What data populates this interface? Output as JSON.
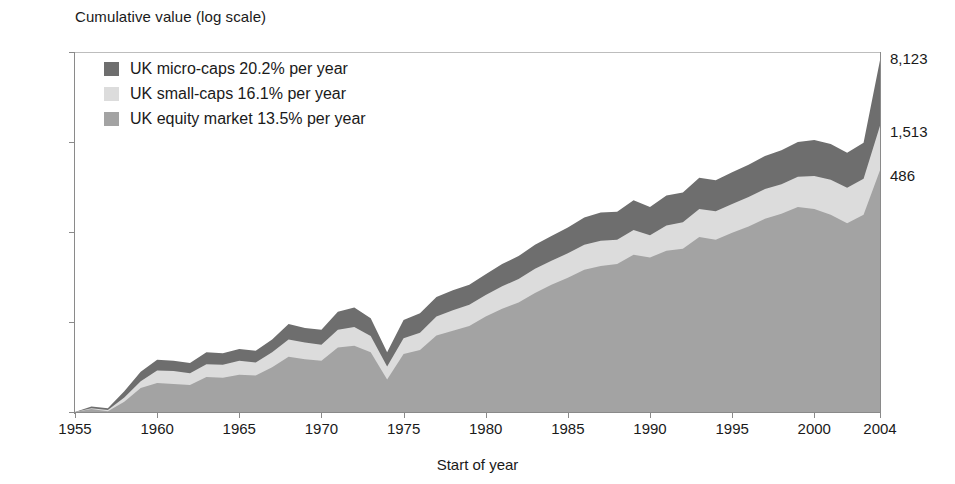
{
  "chart_data": {
    "type": "area",
    "title": "Cumulative value (log scale)",
    "xlabel": "Start of year",
    "ylabel": "Cumulative value (log scale)",
    "log_scale": true,
    "grid": false,
    "legend_position": "top-left",
    "xlim": [
      1955,
      2004
    ],
    "ylim": [
      1,
      10000
    ],
    "y_ticks": [
      "10,000",
      "1,000",
      "100",
      "10",
      "1"
    ],
    "y_tick_values": [
      10000,
      1000,
      100,
      10,
      1
    ],
    "x_ticks": [
      "1955",
      "1960",
      "1965",
      "1970",
      "1975",
      "1980",
      "1985",
      "1990",
      "1995",
      "2000",
      "2004"
    ],
    "x_tick_values": [
      1955,
      1960,
      1965,
      1970,
      1975,
      1980,
      1985,
      1990,
      1995,
      2000,
      2004
    ],
    "x": [
      1955,
      1956,
      1957,
      1958,
      1959,
      1960,
      1961,
      1962,
      1963,
      1964,
      1965,
      1966,
      1967,
      1968,
      1969,
      1970,
      1971,
      1972,
      1973,
      1974,
      1975,
      1976,
      1977,
      1978,
      1979,
      1980,
      1981,
      1982,
      1983,
      1984,
      1985,
      1986,
      1987,
      1988,
      1989,
      1990,
      1991,
      1992,
      1993,
      1994,
      1995,
      1996,
      1997,
      1998,
      1999,
      2000,
      2001,
      2002,
      2003,
      2004
    ],
    "series": [
      {
        "name": "UK equity market",
        "label": "UK equity market 13.5% per year",
        "annual_return_pct": 13.5,
        "end_value": 486,
        "end_label": "486",
        "color": "#a3a3a3",
        "values": [
          1.0,
          1.08,
          1.02,
          1.3,
          1.85,
          2.1,
          2.05,
          2.0,
          2.45,
          2.4,
          2.6,
          2.55,
          3.15,
          4.1,
          3.85,
          3.7,
          5.2,
          5.45,
          4.6,
          2.3,
          4.4,
          4.9,
          7.1,
          8.0,
          9.0,
          11.5,
          14.0,
          16.5,
          21.0,
          26.0,
          31.0,
          38.0,
          42.0,
          44.0,
          56.0,
          52.0,
          62.0,
          65.0,
          88.0,
          82.0,
          98.0,
          115.0,
          140.0,
          160.0,
          190.0,
          180.0,
          155.0,
          125.0,
          155.0,
          486.0
        ]
      },
      {
        "name": "UK small-caps",
        "label": "UK small-caps 16.1% per year",
        "annual_return_pct": 16.1,
        "end_value": 1513,
        "end_label": "1,513",
        "color": "#dcdcdc",
        "values": [
          1.0,
          1.1,
          1.05,
          1.45,
          2.2,
          2.9,
          2.85,
          2.7,
          3.4,
          3.35,
          3.7,
          3.55,
          4.6,
          6.4,
          5.9,
          5.6,
          8.2,
          8.8,
          7.0,
          3.2,
          6.6,
          7.6,
          11.5,
          13.5,
          15.5,
          20.0,
          25.0,
          30.0,
          39.0,
          48.0,
          58.0,
          72.0,
          80.0,
          82.0,
          105.0,
          92.0,
          118.0,
          128.0,
          180.0,
          170.0,
          205.0,
          245.0,
          300.0,
          340.0,
          410.0,
          420.0,
          380.0,
          310.0,
          390.0,
          1513.0
        ]
      },
      {
        "name": "UK micro-caps",
        "label": "UK micro-caps 20.2% per year",
        "annual_return_pct": 20.2,
        "end_value": 8123,
        "end_label": "8,123",
        "color": "#6e6e6e",
        "values": [
          1.0,
          1.15,
          1.1,
          1.7,
          2.8,
          3.8,
          3.7,
          3.5,
          4.6,
          4.5,
          5.0,
          4.8,
          6.4,
          9.5,
          8.6,
          8.2,
          13.0,
          14.5,
          11.0,
          4.6,
          10.5,
          12.5,
          19.0,
          22.5,
          26.0,
          34.0,
          44.0,
          54.0,
          72.0,
          90.0,
          112.0,
          145.0,
          165.0,
          168.0,
          225.0,
          190.0,
          255.0,
          275.0,
          400.0,
          375.0,
          460.0,
          560.0,
          700.0,
          810.0,
          1000.0,
          1050.0,
          950.0,
          760.0,
          980.0,
          8123.0
        ]
      }
    ]
  },
  "axis_titles": {
    "y": "Cumulative value (log scale)",
    "x": "Start of year"
  },
  "legend": {
    "items": [
      {
        "label": "UK micro-caps 20.2% per year",
        "color": "#6e6e6e",
        "swatch": "legend-swatch-micro-caps"
      },
      {
        "label": "UK small-caps 16.1% per year",
        "color": "#dcdcdc",
        "swatch": "legend-swatch-small-caps"
      },
      {
        "label": "UK equity market 13.5% per year",
        "color": "#a3a3a3",
        "swatch": "legend-swatch-equity-market"
      }
    ]
  },
  "end_labels": [
    {
      "text": "8,123",
      "series": "UK micro-caps"
    },
    {
      "text": "1,513",
      "series": "UK small-caps"
    },
    {
      "text": "486",
      "series": "UK equity market"
    }
  ],
  "colors": {
    "micro_caps": "#6e6e6e",
    "small_caps": "#dcdcdc",
    "equity_market": "#a3a3a3",
    "axis": "#8a8a8a",
    "text": "#1a1a1a",
    "background": "#ffffff"
  }
}
